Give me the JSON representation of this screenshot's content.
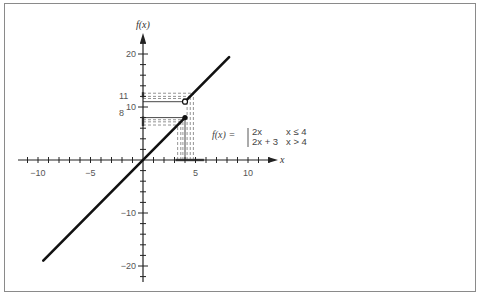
{
  "chart_data": {
    "type": "line",
    "title": "",
    "xlabel": "x",
    "ylabel": "f(x)",
    "xlim": [
      -10,
      10
    ],
    "ylim": [
      -20,
      20
    ],
    "grid": false,
    "x_ticks": [
      -10,
      -5,
      5,
      10
    ],
    "y_ticks": [
      20,
      10,
      -10,
      -20
    ],
    "x_tick_labels": [
      "−10",
      "−5",
      "5",
      "10"
    ],
    "y_tick_labels": [
      "20",
      "10",
      "−10",
      "−20"
    ],
    "annotations": [
      {
        "text": "11",
        "at_y": 11
      },
      {
        "text": "8",
        "at_y": 8
      }
    ],
    "formula": {
      "lhs": "f(x) =",
      "cases": [
        {
          "expr": "2x",
          "condition": "x ≤ 4"
        },
        {
          "expr": "2x + 3",
          "condition": "x > 4"
        }
      ]
    },
    "series": [
      {
        "name": "2x (x ≤ 4)",
        "x": [
          -9.5,
          4
        ],
        "y": [
          -19,
          8
        ],
        "endpoint": "closed"
      },
      {
        "name": "2x + 3 (x > 4)",
        "x": [
          4,
          8.2
        ],
        "y": [
          11,
          19.4
        ],
        "endpoint_start": "open"
      }
    ],
    "guide_lines": {
      "description": "dashed limit guides near x=4 converging to y=8 and y=11",
      "x_values": [
        3.3,
        3.6,
        3.8,
        4,
        4.2,
        4.5,
        4.8
      ],
      "y_values": [
        6.6,
        7.2,
        7.6,
        8,
        11,
        12,
        12.6
      ]
    }
  }
}
